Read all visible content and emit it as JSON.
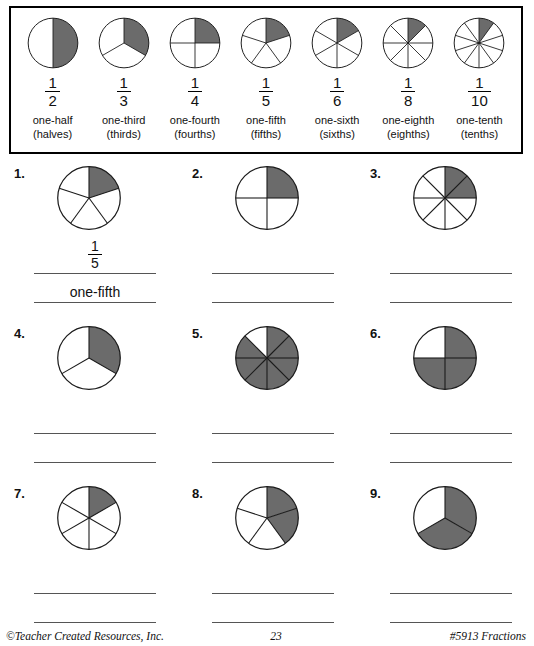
{
  "page": {
    "shade_color": "#6b6b6b",
    "line_color": "#1a1a1a"
  },
  "key": {
    "items": [
      {
        "numerator": "1",
        "denominator": "2",
        "name": "one-half",
        "plural": "(halves)",
        "parts": 2,
        "shaded": 1
      },
      {
        "numerator": "1",
        "denominator": "3",
        "name": "one-third",
        "plural": "(thirds)",
        "parts": 3,
        "shaded": 1
      },
      {
        "numerator": "1",
        "denominator": "4",
        "name": "one-fourth",
        "plural": "(fourths)",
        "parts": 4,
        "shaded": 1
      },
      {
        "numerator": "1",
        "denominator": "5",
        "name": "one-fifth",
        "plural": "(fifths)",
        "parts": 5,
        "shaded": 1
      },
      {
        "numerator": "1",
        "denominator": "6",
        "name": "one-sixth",
        "plural": "(sixths)",
        "parts": 6,
        "shaded": 1
      },
      {
        "numerator": "1",
        "denominator": "8",
        "name": "one-eighth",
        "plural": "(eighths)",
        "parts": 8,
        "shaded": 1
      },
      {
        "numerator": "1",
        "denominator": "10",
        "name": "one-tenth",
        "plural": "(tenths)",
        "parts": 10,
        "shaded": 1
      }
    ]
  },
  "problems": [
    {
      "number": "1.",
      "parts": 5,
      "shaded": 1,
      "answer_fraction_numerator": "1",
      "answer_fraction_denominator": "5",
      "answer_word": "one-fifth",
      "answered": true
    },
    {
      "number": "2.",
      "parts": 4,
      "shaded": 1,
      "answer_fraction_numerator": "",
      "answer_fraction_denominator": "",
      "answer_word": "",
      "answered": false
    },
    {
      "number": "3.",
      "parts": 8,
      "shaded": 2,
      "answer_fraction_numerator": "",
      "answer_fraction_denominator": "",
      "answer_word": "",
      "answered": false
    },
    {
      "number": "4.",
      "parts": 3,
      "shaded": 1,
      "answer_fraction_numerator": "",
      "answer_fraction_denominator": "",
      "answer_word": "",
      "answered": false
    },
    {
      "number": "5.",
      "parts": 8,
      "shaded": 7,
      "answer_fraction_numerator": "",
      "answer_fraction_denominator": "",
      "answer_word": "",
      "answered": false
    },
    {
      "number": "6.",
      "parts": 4,
      "shaded": 3,
      "answer_fraction_numerator": "",
      "answer_fraction_denominator": "",
      "answer_word": "",
      "answered": false
    },
    {
      "number": "7.",
      "parts": 6,
      "shaded": 1,
      "answer_fraction_numerator": "",
      "answer_fraction_denominator": "",
      "answer_word": "",
      "answered": false
    },
    {
      "number": "8.",
      "parts": 5,
      "shaded": 2,
      "answer_fraction_numerator": "",
      "answer_fraction_denominator": "",
      "answer_word": "",
      "answered": false
    },
    {
      "number": "9.",
      "parts": 3,
      "shaded": 2,
      "answer_fraction_numerator": "",
      "answer_fraction_denominator": "",
      "answer_word": "",
      "answered": false
    }
  ],
  "footer": {
    "left": "©Teacher Created Resources, Inc.",
    "page_number": "23",
    "right": "#5913 Fractions"
  }
}
